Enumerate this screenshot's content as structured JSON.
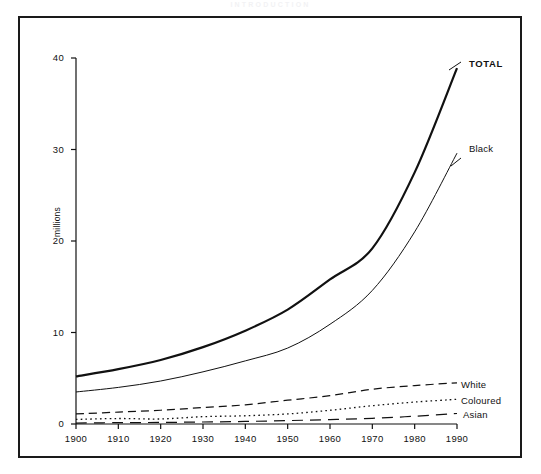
{
  "page": {
    "running_head": "INTRODUCTION"
  },
  "figure": {
    "frame": true,
    "y_axis_title": "millions"
  },
  "axes": {
    "y_ticks": [
      "0",
      "10",
      "20",
      "30",
      "40"
    ],
    "x_ticks": [
      "1900",
      "1910",
      "1920",
      "1930",
      "1940",
      "1950",
      "1960",
      "1970",
      "1980",
      "1990"
    ]
  },
  "series_labels": {
    "total": "TOTAL",
    "black": "Black",
    "white": "White",
    "coloured": "Coloured",
    "asian": "Asian"
  },
  "colors": {
    "ink": "#111111",
    "frame": "#1a1a1a",
    "background": "#ffffff"
  },
  "chart_data": {
    "type": "line",
    "title": "",
    "xlabel": "",
    "ylabel": "millions",
    "xlim": [
      1900,
      1990
    ],
    "ylim": [
      0,
      40
    ],
    "grid": false,
    "legend": "inline-right-end-labels",
    "x": [
      1900,
      1910,
      1920,
      1930,
      1940,
      1950,
      1960,
      1970,
      1980,
      1990
    ],
    "series": [
      {
        "name": "TOTAL",
        "style": "solid-thick",
        "values": [
          5.2,
          6.0,
          7.0,
          8.4,
          10.2,
          12.5,
          15.8,
          19.2,
          27.5,
          38.9
        ]
      },
      {
        "name": "Black",
        "style": "solid-thin",
        "values": [
          3.5,
          4.0,
          4.7,
          5.7,
          6.9,
          8.3,
          10.9,
          14.6,
          21.0,
          29.6
        ]
      },
      {
        "name": "White",
        "style": "dashed",
        "values": [
          1.1,
          1.3,
          1.5,
          1.8,
          2.1,
          2.6,
          3.1,
          3.8,
          4.2,
          4.5
        ]
      },
      {
        "name": "Coloured",
        "style": "dotted",
        "values": [
          0.5,
          0.6,
          0.55,
          0.8,
          0.9,
          1.1,
          1.5,
          2.0,
          2.4,
          2.7
        ]
      },
      {
        "name": "Asian",
        "style": "long-dashed",
        "values": [
          0.1,
          0.15,
          0.17,
          0.22,
          0.28,
          0.37,
          0.48,
          0.62,
          0.85,
          1.15
        ]
      }
    ]
  }
}
